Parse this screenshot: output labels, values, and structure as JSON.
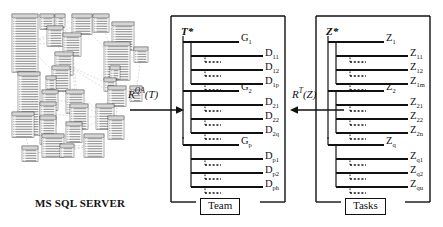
{
  "figure": {
    "left_panel": {
      "caption": "MS SQL SERVER",
      "description": "entity-relationship-diagram"
    },
    "arrows": [
      {
        "id": "qa",
        "base": "R",
        "sup": "QA",
        "arg": "(T)",
        "direction": "right"
      },
      {
        "id": "tz",
        "base": "R",
        "sup": "T",
        "arg": "(Z)",
        "direction": "left"
      }
    ],
    "team_panel": {
      "caption": "Team",
      "root": {
        "base": "T",
        "sub": "*"
      },
      "groups": [
        {
          "base": "G",
          "sub": "1",
          "leaves": [
            {
              "base": "D",
              "sub": "11"
            },
            {
              "base": "D",
              "sub": "12"
            },
            {
              "base": "D",
              "sub": "1p"
            }
          ]
        },
        {
          "base": "G",
          "sub": "2",
          "leaves": [
            {
              "base": "D",
              "sub": "21"
            },
            {
              "base": "D",
              "sub": "22"
            },
            {
              "base": "D",
              "sub": "2q"
            }
          ]
        },
        {
          "base": "G",
          "sub": "p",
          "leaves": [
            {
              "base": "D",
              "sub": "p1"
            },
            {
              "base": "D",
              "sub": "p2"
            },
            {
              "base": "D",
              "sub": "ph"
            }
          ]
        }
      ]
    },
    "tasks_panel": {
      "caption": "Tasks",
      "root": {
        "base": "Z",
        "sub": "*"
      },
      "groups": [
        {
          "base": "Z",
          "sub": "1",
          "leaves": [
            {
              "base": "Z",
              "sub": "11"
            },
            {
              "base": "Z",
              "sub": "12"
            },
            {
              "base": "Z",
              "sub": "1m"
            }
          ]
        },
        {
          "base": "Z",
          "sub": "2",
          "leaves": [
            {
              "base": "Z",
              "sub": "21"
            },
            {
              "base": "Z",
              "sub": "22"
            },
            {
              "base": "Z",
              "sub": "2n"
            }
          ]
        },
        {
          "base": "Z",
          "sub": "q",
          "leaves": [
            {
              "base": "Z",
              "sub": "q1"
            },
            {
              "base": "Z",
              "sub": "q2"
            },
            {
              "base": "Z",
              "sub": "qu"
            }
          ]
        }
      ]
    },
    "colors": {
      "ink": "#111111",
      "background": "#ffffff",
      "er_line": "#9a9a9a"
    }
  }
}
